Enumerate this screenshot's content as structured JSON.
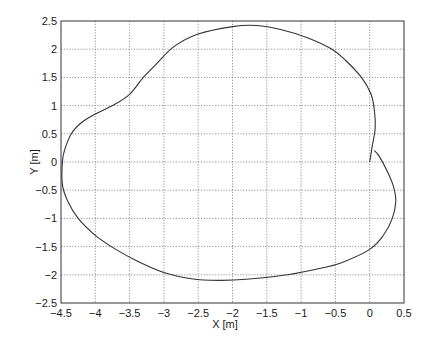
{
  "chart_data": {
    "type": "line",
    "title": "",
    "xlabel": "X [m]",
    "ylabel": "Y [m]",
    "xlim": [
      -4.5,
      0.5
    ],
    "ylim": [
      -2.5,
      2.5
    ],
    "xticks": [
      -4.5,
      -4,
      -3.5,
      -3,
      -2.5,
      -2,
      -1.5,
      -1,
      -0.5,
      0,
      0.5
    ],
    "yticks": [
      -2.5,
      -2,
      -1.5,
      -1,
      -0.5,
      0,
      0.5,
      1,
      1.5,
      2,
      2.5
    ],
    "xtick_labels": [
      "−4.5",
      "−4",
      "−3.5",
      "−3",
      "−2.5",
      "−2",
      "−1.5",
      "−1",
      "−0.5",
      "0",
      "0.5"
    ],
    "ytick_labels": [
      "−2.5",
      "−2",
      "−1.5",
      "−1",
      "−0.5",
      "0",
      "0.5",
      "1",
      "1.5",
      "2",
      "2.5"
    ],
    "grid": true,
    "legend": null,
    "series": [
      {
        "name": "trajectory",
        "color": "#333333",
        "x": [
          0.0,
          0.04,
          0.08,
          0.07,
          0.02,
          -0.12,
          -0.35,
          -0.55,
          -0.9,
          -1.3,
          -1.65,
          -2.0,
          -2.5,
          -2.85,
          -3.1,
          -3.3,
          -3.5,
          -3.75,
          -4.0,
          -4.2,
          -4.35,
          -4.45,
          -4.48,
          -4.48,
          -4.4,
          -4.25,
          -4.0,
          -3.7,
          -3.4,
          -3.0,
          -2.6,
          -2.2,
          -1.8,
          -1.2,
          -0.7,
          -0.4,
          0.0,
          0.2,
          0.33,
          0.38,
          0.35,
          0.27,
          0.14,
          0.07
        ],
        "y": [
          0.0,
          0.3,
          0.6,
          0.9,
          1.2,
          1.5,
          1.8,
          2.0,
          2.2,
          2.35,
          2.42,
          2.4,
          2.27,
          2.05,
          1.75,
          1.5,
          1.2,
          1.0,
          0.85,
          0.7,
          0.5,
          0.2,
          0.0,
          -0.4,
          -0.7,
          -1.0,
          -1.3,
          -1.55,
          -1.75,
          -1.96,
          -2.07,
          -2.1,
          -2.08,
          -2.0,
          -1.88,
          -1.78,
          -1.55,
          -1.3,
          -1.0,
          -0.7,
          -0.45,
          -0.2,
          0.1,
          0.2
        ]
      }
    ]
  }
}
